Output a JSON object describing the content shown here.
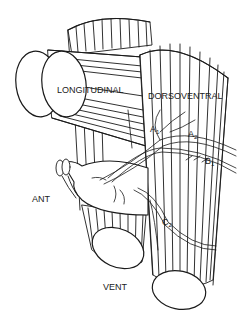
{
  "diagram": {
    "type": "anatomical line drawing",
    "colors": {
      "ink": "#1a1a1a",
      "background": "#ffffff"
    },
    "structures": [
      {
        "name": "longitudinal-muscle",
        "label": "LONGITUDINAL"
      },
      {
        "name": "dorsoventral-muscle",
        "label": "DORSOVENTRAL"
      },
      {
        "name": "ventral-muscle-bundle"
      },
      {
        "name": "anterior-organ"
      }
    ],
    "labels": {
      "longitudinal": "LONGITUDINAL",
      "dorsoventral": "DORSOVENTRAL",
      "ant": "ANT",
      "vent": "VENT",
      "a1_main": "A",
      "a1_sub": "1",
      "a2_main": "A",
      "a2_sub": "2",
      "b1_main": "B",
      "b1_sub": "1",
      "c2_main": "C",
      "c2_sub": "2"
    }
  }
}
